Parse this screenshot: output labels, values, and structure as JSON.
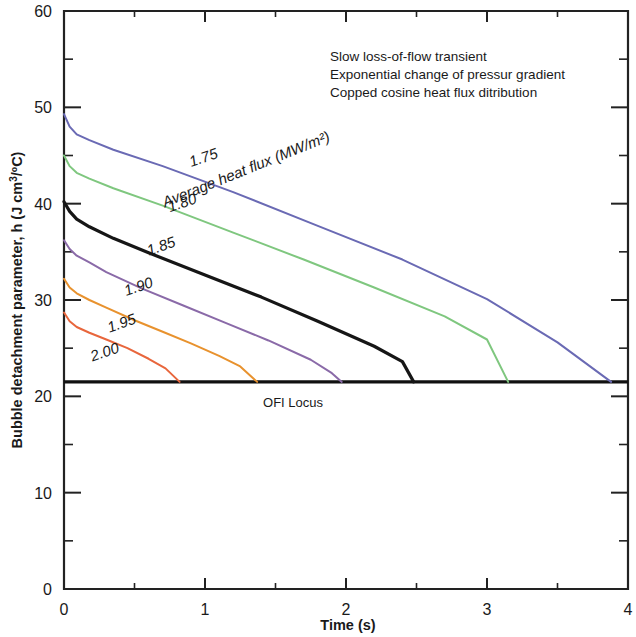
{
  "chart_data": {
    "type": "line",
    "title": "",
    "xlabel": "Time (s)",
    "ylabel_full": "Bubble detachment parameter, h (J cm3/ºC)",
    "ylabel_prefix": "Bubble detachment parameter, ",
    "ylabel_symbol": "h",
    "ylabel_unit_open": " (J cm",
    "ylabel_unit_sup": "3",
    "ylabel_unit_close": "/ºC)",
    "xlim": [
      0,
      4
    ],
    "ylim": [
      0,
      60
    ],
    "xticks_major": [
      "0",
      "1",
      "2",
      "3",
      "4"
    ],
    "xticks_major_values": [
      0,
      1,
      2,
      3,
      4
    ],
    "xticks_minor_values": [
      0.5,
      1.5,
      2.5,
      3.5
    ],
    "yticks_major": [
      "0",
      "10",
      "20",
      "30",
      "40",
      "50",
      "60"
    ],
    "yticks_major_values": [
      0,
      10,
      20,
      30,
      40,
      50,
      60
    ],
    "yticks_minor_values": [
      5,
      15,
      25,
      35,
      45,
      55
    ],
    "grid": false,
    "legend_position": "inline-curve-labels",
    "series_title": "Average heat flux (MW/m²)",
    "ofi_locus_label": "OFI Locus",
    "ofi_locus_value": 21.5,
    "series": [
      {
        "name": "1.75",
        "label": "1.75",
        "color": "#6a6ab4",
        "label_x": 1.0,
        "label_y": 44.3,
        "points": [
          [
            0.0,
            49.3
          ],
          [
            0.04,
            48.0
          ],
          [
            0.09,
            47.2
          ],
          [
            0.18,
            46.6
          ],
          [
            0.35,
            45.6
          ],
          [
            0.7,
            43.9
          ],
          [
            1.2,
            41.2
          ],
          [
            1.8,
            37.7
          ],
          [
            2.4,
            34.2
          ],
          [
            3.0,
            30.1
          ],
          [
            3.5,
            25.6
          ],
          [
            3.88,
            21.5
          ]
        ]
      },
      {
        "name": "1.80",
        "label": "1.80",
        "color": "#7fc77f",
        "label_x": 0.85,
        "label_y": 39.6,
        "points": [
          [
            0.0,
            45.0
          ],
          [
            0.04,
            43.9
          ],
          [
            0.09,
            43.2
          ],
          [
            0.18,
            42.6
          ],
          [
            0.35,
            41.6
          ],
          [
            0.7,
            39.8
          ],
          [
            1.2,
            37.0
          ],
          [
            1.7,
            34.2
          ],
          [
            2.2,
            31.3
          ],
          [
            2.7,
            28.3
          ],
          [
            3.0,
            25.9
          ],
          [
            3.15,
            21.5
          ]
        ]
      },
      {
        "name": "1.85",
        "label": "1.85",
        "color": "#161616",
        "label_x": 0.7,
        "label_y": 35.1,
        "points": [
          [
            0.0,
            40.2
          ],
          [
            0.04,
            39.2
          ],
          [
            0.09,
            38.4
          ],
          [
            0.18,
            37.6
          ],
          [
            0.35,
            36.4
          ],
          [
            0.6,
            34.9
          ],
          [
            1.0,
            32.6
          ],
          [
            1.4,
            30.3
          ],
          [
            1.8,
            27.8
          ],
          [
            2.2,
            25.2
          ],
          [
            2.4,
            23.6
          ],
          [
            2.48,
            21.5
          ]
        ]
      },
      {
        "name": "1.90",
        "label": "1.90",
        "color": "#8a6aa8",
        "label_x": 0.54,
        "label_y": 30.9,
        "points": [
          [
            0.0,
            36.2
          ],
          [
            0.04,
            35.3
          ],
          [
            0.09,
            34.6
          ],
          [
            0.18,
            33.9
          ],
          [
            0.3,
            32.9
          ],
          [
            0.55,
            31.2
          ],
          [
            0.85,
            29.4
          ],
          [
            1.15,
            27.6
          ],
          [
            1.45,
            25.8
          ],
          [
            1.75,
            23.8
          ],
          [
            1.9,
            22.4
          ],
          [
            1.97,
            21.5
          ]
        ]
      },
      {
        "name": "1.95",
        "label": "1.95",
        "color": "#e8922e",
        "label_x": 0.42,
        "label_y": 27.1,
        "points": [
          [
            0.0,
            32.2
          ],
          [
            0.04,
            31.3
          ],
          [
            0.09,
            30.7
          ],
          [
            0.18,
            30.0
          ],
          [
            0.3,
            29.2
          ],
          [
            0.5,
            27.9
          ],
          [
            0.7,
            26.7
          ],
          [
            0.9,
            25.5
          ],
          [
            1.1,
            24.2
          ],
          [
            1.25,
            23.1
          ],
          [
            1.37,
            21.5
          ]
        ]
      },
      {
        "name": "2.00",
        "label": "2.00",
        "color": "#e8663c",
        "label_x": 0.3,
        "label_y": 24.1,
        "points": [
          [
            0.0,
            28.7
          ],
          [
            0.04,
            27.8
          ],
          [
            0.09,
            27.2
          ],
          [
            0.18,
            26.6
          ],
          [
            0.3,
            25.9
          ],
          [
            0.45,
            25.0
          ],
          [
            0.6,
            23.9
          ],
          [
            0.72,
            22.9
          ],
          [
            0.82,
            21.5
          ]
        ]
      }
    ],
    "annotations": [
      "Slow loss-of-flow transient",
      "Exponential change of pressur gradient",
      "Copped cosine heat flux ditribution"
    ]
  }
}
